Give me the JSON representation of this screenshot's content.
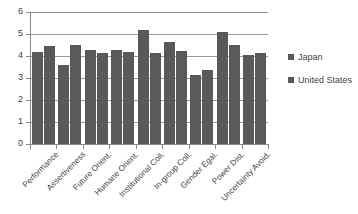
{
  "chart_data": {
    "type": "bar",
    "title": "",
    "subtitle": "",
    "xlabel": "",
    "ylabel": "",
    "ylim": [
      0,
      6
    ],
    "ytick_step": 1,
    "ytick_labels": [
      "6",
      "5",
      "4",
      "3",
      "2",
      "1",
      "0"
    ],
    "grid": true,
    "grid_axis": "y",
    "legend_position": "right",
    "categories": [
      "Performance",
      "Assertiveness",
      "Future Orient.",
      "Humane Orient.",
      "Institutional Coll.",
      "In-group Coll.",
      "Gender Egal.",
      "Power Dist.",
      "Uncertainty Avoid."
    ],
    "series": [
      {
        "name": "Japan",
        "color": "#595959",
        "values": [
          4.18,
          3.58,
          4.27,
          4.27,
          5.2,
          4.62,
          3.15,
          5.1,
          4.06
        ]
      },
      {
        "name": "United States",
        "color": "#595959",
        "values": [
          4.45,
          4.52,
          4.13,
          4.17,
          4.15,
          4.23,
          3.35,
          4.5,
          4.13
        ]
      }
    ]
  },
  "legend": {
    "items": [
      {
        "label": "Japan",
        "color": "#595959"
      },
      {
        "label": "United States",
        "color": "#595959"
      }
    ]
  }
}
